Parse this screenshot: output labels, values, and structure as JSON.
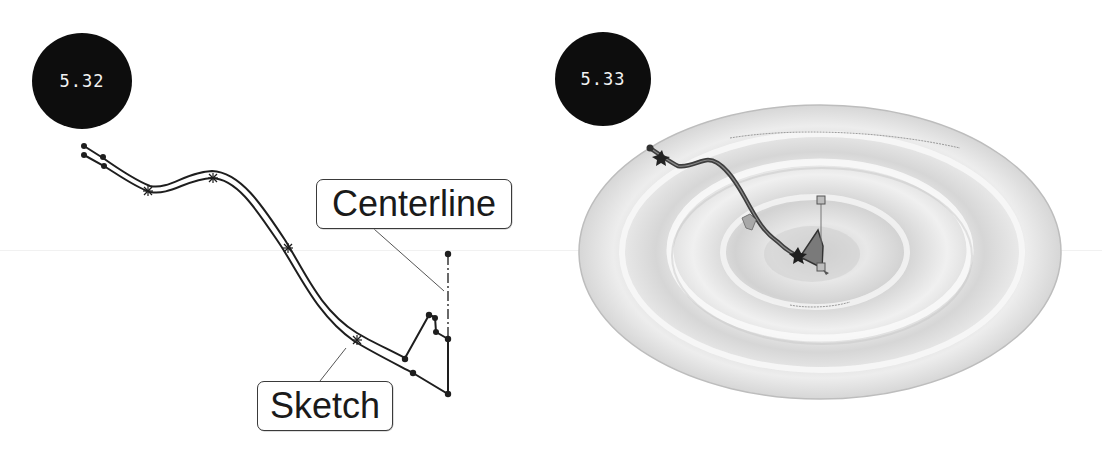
{
  "figures": [
    {
      "id": "left",
      "badge_label": "5.32",
      "description": "2D sketch profile with centerline",
      "callouts": {
        "centerline": "Centerline",
        "sketch": "Sketch"
      }
    },
    {
      "id": "right",
      "badge_label": "5.33",
      "description": "Revolved 3D surface with sketch overlay"
    }
  ],
  "colors": {
    "badge_bg": "#0d0d0d",
    "badge_text": "#f2f2f2",
    "sketch_line": "#1e1e1e",
    "callout_border": "#3a3a3a",
    "surface_light": "#eeeeee",
    "surface_mid": "#d4d4d4",
    "surface_dark": "#bdbdbd"
  }
}
